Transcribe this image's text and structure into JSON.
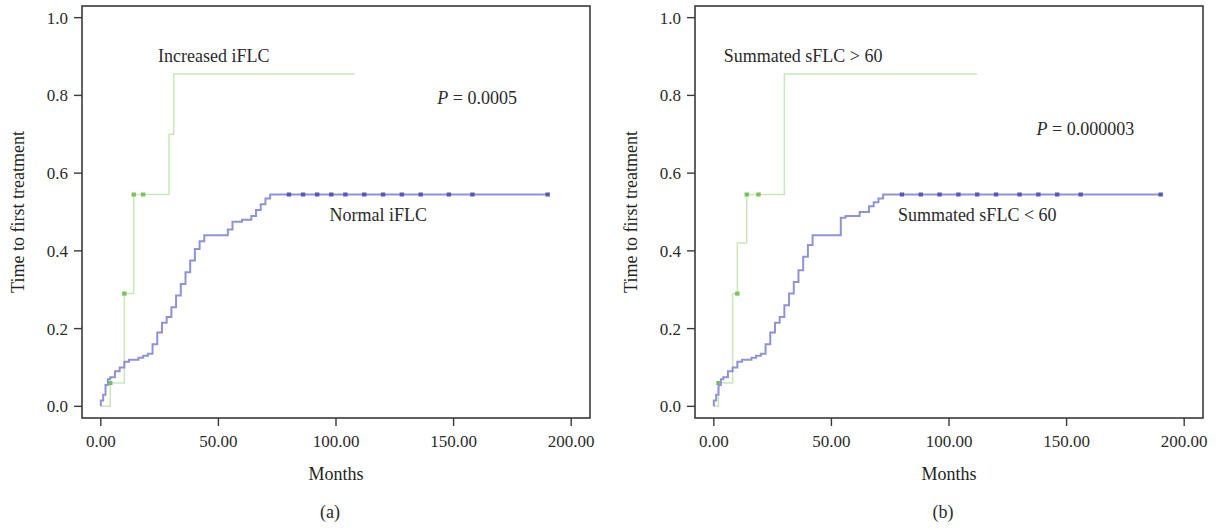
{
  "figure": {
    "panels": [
      {
        "id": "a",
        "caption": "(a)",
        "xlabel": "Months",
        "ylabel": "Time to first treatment",
        "xticks": [
          "0.00",
          "50.00",
          "100.00",
          "150.00",
          "200.00"
        ],
        "yticks": [
          "0.0",
          "0.2",
          "0.4",
          "0.6",
          "0.8",
          "1.0"
        ],
        "pvalue_symbol": "P",
        "pvalue_text": " = 0.0005",
        "label_high": "Increased iFLC",
        "label_low": "Normal iFLC"
      },
      {
        "id": "b",
        "caption": "(b)",
        "xlabel": "Months",
        "ylabel": "Time to first treatment",
        "xticks": [
          "0.00",
          "50.00",
          "100.00",
          "150.00",
          "200.00"
        ],
        "yticks": [
          "0.0",
          "0.2",
          "0.4",
          "0.6",
          "0.8",
          "1.0"
        ],
        "pvalue_symbol": "P",
        "pvalue_text": " = 0.000003",
        "label_high": "Summated sFLC > 60",
        "label_low": "Summated sFLC < 60"
      }
    ],
    "colors": {
      "high_curve": "#c9e8b9",
      "high_censor": "#79c255",
      "low_curve": "#8f93d6",
      "low_censor": "#5558b5",
      "axis": "#3a3a3a",
      "text": "#2b2b2b"
    }
  },
  "chart_data": [
    {
      "type": "line",
      "subtype": "kaplan-meier-cumulative-incidence",
      "title": "",
      "panel": "(a)",
      "xlabel": "Months",
      "ylabel": "Time to first treatment",
      "xlim": [
        -8,
        208
      ],
      "ylim": [
        -0.03,
        1.03
      ],
      "xticks": [
        0,
        50,
        100,
        150,
        200
      ],
      "yticks": [
        0.0,
        0.2,
        0.4,
        0.6,
        0.8,
        1.0
      ],
      "grid": false,
      "legend": "in-plot annotations",
      "annotations": [
        {
          "text": "Increased iFLC",
          "x": 48,
          "y": 0.9
        },
        {
          "text": "Normal iFLC",
          "x": 118,
          "y": 0.49
        },
        {
          "text": "P = 0.0005",
          "x": 160,
          "y": 0.79
        }
      ],
      "series": [
        {
          "name": "Increased iFLC",
          "color": "#c9e8b9",
          "x": [
            0,
            1,
            4,
            4,
            10,
            10,
            14,
            14,
            29,
            29,
            31,
            31,
            32
          ],
          "y": [
            0.0,
            0.0,
            0.0,
            0.06,
            0.06,
            0.29,
            0.29,
            0.545,
            0.545,
            0.7,
            0.7,
            0.855,
            0.855
          ],
          "plateau_to_x": 108,
          "plateau_y": 0.855,
          "censor_points": [
            {
              "x": 4,
              "y": 0.06
            },
            {
              "x": 10,
              "y": 0.29
            },
            {
              "x": 14,
              "y": 0.545
            },
            {
              "x": 18,
              "y": 0.545
            }
          ]
        },
        {
          "name": "Normal iFLC",
          "color": "#8f93d6",
          "x": [
            0,
            0,
            1,
            2,
            3,
            4,
            6,
            8,
            10,
            12,
            14,
            16,
            18,
            20,
            22,
            24,
            26,
            28,
            30,
            32,
            34,
            36,
            38,
            40,
            42,
            44,
            48,
            52,
            54,
            56,
            60,
            64,
            66,
            68,
            70,
            72,
            74
          ],
          "y": [
            0.0,
            0.015,
            0.03,
            0.055,
            0.07,
            0.075,
            0.09,
            0.1,
            0.115,
            0.12,
            0.12,
            0.125,
            0.13,
            0.135,
            0.16,
            0.19,
            0.215,
            0.23,
            0.255,
            0.285,
            0.315,
            0.345,
            0.375,
            0.405,
            0.425,
            0.44,
            0.44,
            0.44,
            0.455,
            0.475,
            0.48,
            0.49,
            0.505,
            0.52,
            0.535,
            0.545,
            0.545
          ],
          "plateau_to_x": 190,
          "plateau_y": 0.545,
          "censor_points": [
            {
              "x": 80,
              "y": 0.545
            },
            {
              "x": 86,
              "y": 0.545
            },
            {
              "x": 92,
              "y": 0.545
            },
            {
              "x": 98,
              "y": 0.545
            },
            {
              "x": 104,
              "y": 0.545
            },
            {
              "x": 112,
              "y": 0.545
            },
            {
              "x": 120,
              "y": 0.545
            },
            {
              "x": 128,
              "y": 0.545
            },
            {
              "x": 136,
              "y": 0.545
            },
            {
              "x": 148,
              "y": 0.545
            },
            {
              "x": 158,
              "y": 0.545
            },
            {
              "x": 190,
              "y": 0.545
            }
          ]
        }
      ]
    },
    {
      "type": "line",
      "subtype": "kaplan-meier-cumulative-incidence",
      "title": "",
      "panel": "(b)",
      "xlabel": "Months",
      "ylabel": "Time to first treatment",
      "xlim": [
        -8,
        208
      ],
      "ylim": [
        -0.03,
        1.03
      ],
      "xticks": [
        0,
        50,
        100,
        150,
        200
      ],
      "yticks": [
        0.0,
        0.2,
        0.4,
        0.6,
        0.8,
        1.0
      ],
      "grid": false,
      "legend": "in-plot annotations",
      "annotations": [
        {
          "text": "Summated sFLC > 60",
          "x": 38,
          "y": 0.9
        },
        {
          "text": "Summated sFLC < 60",
          "x": 112,
          "y": 0.49
        },
        {
          "text": "P = 0.000003",
          "x": 158,
          "y": 0.71
        }
      ],
      "series": [
        {
          "name": "Summated sFLC > 60",
          "color": "#c9e8b9",
          "x": [
            0,
            1,
            2,
            2,
            8,
            8,
            10,
            10,
            14,
            14,
            30,
            30,
            32
          ],
          "y": [
            0.0,
            0.0,
            0.0,
            0.06,
            0.06,
            0.29,
            0.29,
            0.42,
            0.42,
            0.545,
            0.545,
            0.855,
            0.855
          ],
          "plateau_to_x": 112,
          "plateau_y": 0.855,
          "censor_points": [
            {
              "x": 2,
              "y": 0.06
            },
            {
              "x": 10,
              "y": 0.29
            },
            {
              "x": 14,
              "y": 0.545
            },
            {
              "x": 19,
              "y": 0.545
            }
          ]
        },
        {
          "name": "Summated sFLC < 60",
          "color": "#8f93d6",
          "x": [
            0,
            0,
            1,
            2,
            3,
            4,
            6,
            8,
            10,
            12,
            14,
            16,
            18,
            20,
            22,
            24,
            26,
            28,
            30,
            32,
            34,
            36,
            38,
            40,
            42,
            46,
            50,
            54,
            56,
            58,
            62,
            66,
            68,
            70,
            72,
            74
          ],
          "y": [
            0.0,
            0.015,
            0.03,
            0.055,
            0.07,
            0.075,
            0.09,
            0.1,
            0.115,
            0.12,
            0.12,
            0.125,
            0.13,
            0.135,
            0.16,
            0.19,
            0.215,
            0.23,
            0.26,
            0.29,
            0.32,
            0.35,
            0.385,
            0.415,
            0.44,
            0.44,
            0.44,
            0.485,
            0.49,
            0.49,
            0.5,
            0.515,
            0.525,
            0.535,
            0.545,
            0.545
          ],
          "plateau_to_x": 190,
          "plateau_y": 0.545,
          "censor_points": [
            {
              "x": 80,
              "y": 0.545
            },
            {
              "x": 88,
              "y": 0.545
            },
            {
              "x": 96,
              "y": 0.545
            },
            {
              "x": 104,
              "y": 0.545
            },
            {
              "x": 112,
              "y": 0.545
            },
            {
              "x": 120,
              "y": 0.545
            },
            {
              "x": 130,
              "y": 0.545
            },
            {
              "x": 138,
              "y": 0.545
            },
            {
              "x": 146,
              "y": 0.545
            },
            {
              "x": 156,
              "y": 0.545
            },
            {
              "x": 190,
              "y": 0.545
            }
          ]
        }
      ]
    }
  ]
}
